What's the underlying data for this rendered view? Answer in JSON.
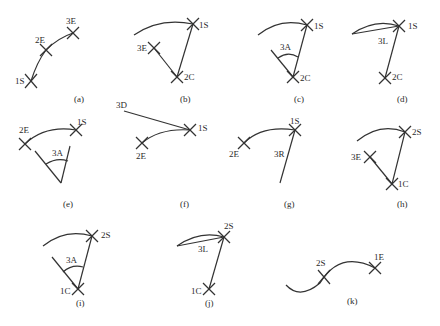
{
  "figure": {
    "panels": [
      {
        "id": "a",
        "caption": "(a)",
        "labels": [
          "1S",
          "2E",
          "3E"
        ]
      },
      {
        "id": "b",
        "caption": "(b)",
        "labels": [
          "1S",
          "3E",
          "2C"
        ]
      },
      {
        "id": "c",
        "caption": "(c)",
        "labels": [
          "1S",
          "3A",
          "2C"
        ]
      },
      {
        "id": "d",
        "caption": "(d)",
        "labels": [
          "1S",
          "3L",
          "2C"
        ]
      },
      {
        "id": "e",
        "caption": "(e)",
        "labels": [
          "2E",
          "1S",
          "3A"
        ]
      },
      {
        "id": "f",
        "caption": "(f)",
        "labels": [
          "3D",
          "1S",
          "2E"
        ]
      },
      {
        "id": "g",
        "caption": "(g)",
        "labels": [
          "1S",
          "2E",
          "3R"
        ]
      },
      {
        "id": "h",
        "caption": "(h)",
        "labels": [
          "2S",
          "3E",
          "1C"
        ]
      },
      {
        "id": "i",
        "caption": "(i)",
        "labels": [
          "2S",
          "3A",
          "1C"
        ]
      },
      {
        "id": "j",
        "caption": "(j)",
        "labels": [
          "2S",
          "3L",
          "1C"
        ]
      },
      {
        "id": "k",
        "caption": "(k)",
        "labels": [
          "2S",
          "1E"
        ]
      }
    ]
  }
}
